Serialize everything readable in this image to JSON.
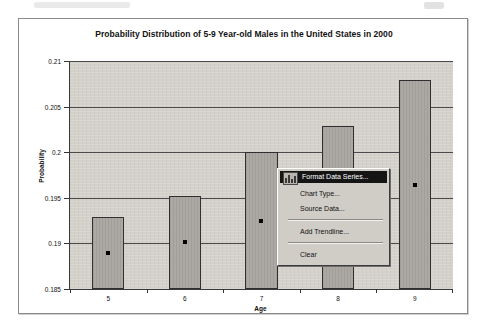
{
  "document": {
    "frame_border_color": "#8a8a8a",
    "page_background": "#ffffff"
  },
  "chart_data": {
    "type": "bar",
    "title": "Probability Distribution of 5-9 Year-old Males in the United States in 2000",
    "xlabel": "Age",
    "ylabel": "Probability",
    "categories": [
      "5",
      "6",
      "7",
      "8",
      "9"
    ],
    "values": [
      0.1929,
      0.1952,
      0.2,
      0.2029,
      0.2079
    ],
    "ylim": [
      0.185,
      0.21
    ],
    "yticks": [
      "0.21",
      "0.205",
      "0.2",
      "0.195",
      "0.19",
      "0.185"
    ],
    "ytick_values": [
      0.21,
      0.205,
      0.2,
      0.195,
      0.19,
      0.185
    ],
    "grid": true,
    "legend": "none",
    "series_selected": true,
    "plot_area_color": "#d4d1cb",
    "bar_fill_color": "#a8a5a0",
    "bar_border_color": "#2f2f2f"
  },
  "context_menu": {
    "selected_index": 0,
    "items": [
      {
        "label": "Format Data Series...",
        "icon": "chart-format-icon",
        "selected": true
      },
      {
        "label": "Chart Type...",
        "selected": false
      },
      {
        "label": "Source Data...",
        "selected": false
      },
      {
        "label": "Add Trendline...",
        "selected": false
      },
      {
        "label": "Clear",
        "selected": false
      }
    ]
  }
}
